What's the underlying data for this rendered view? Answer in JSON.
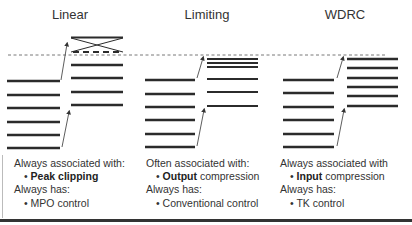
{
  "sections": [
    {
      "title": "Linear",
      "assoc_label": "Always associated with:",
      "assoc_bold": "Peak clipping",
      "assoc_rest": "",
      "has_label": "Always has:",
      "has_item": "MPO control"
    },
    {
      "title": "Limiting",
      "assoc_label": "Often associated with:",
      "assoc_bold": "Output",
      "assoc_rest": " compression",
      "has_label": "Always has:",
      "has_item": "Conventional control"
    },
    {
      "title": "WDRC",
      "assoc_label": "Always associated with",
      "assoc_bold": "Input",
      "assoc_rest": " compression",
      "has_label": "Always has:",
      "has_item": "TK control"
    }
  ],
  "bullet": "•",
  "diagram": {
    "max_output_line_y": 55,
    "linear": {
      "input_lines_y": [
        81,
        95,
        108,
        122,
        135,
        148
      ],
      "output_lines_y": [
        65,
        78,
        92,
        105
      ],
      "clipped": true
    },
    "limiting": {
      "input_lines_y": [
        80,
        94,
        107,
        120,
        134,
        147
      ],
      "output_lines_y": [
        59,
        63,
        67,
        79,
        92,
        106
      ]
    },
    "wdrc": {
      "input_lines_y": [
        80,
        93,
        107,
        120,
        134,
        147
      ],
      "output_lines_y": [
        59,
        68,
        78,
        87,
        96,
        106
      ]
    }
  }
}
